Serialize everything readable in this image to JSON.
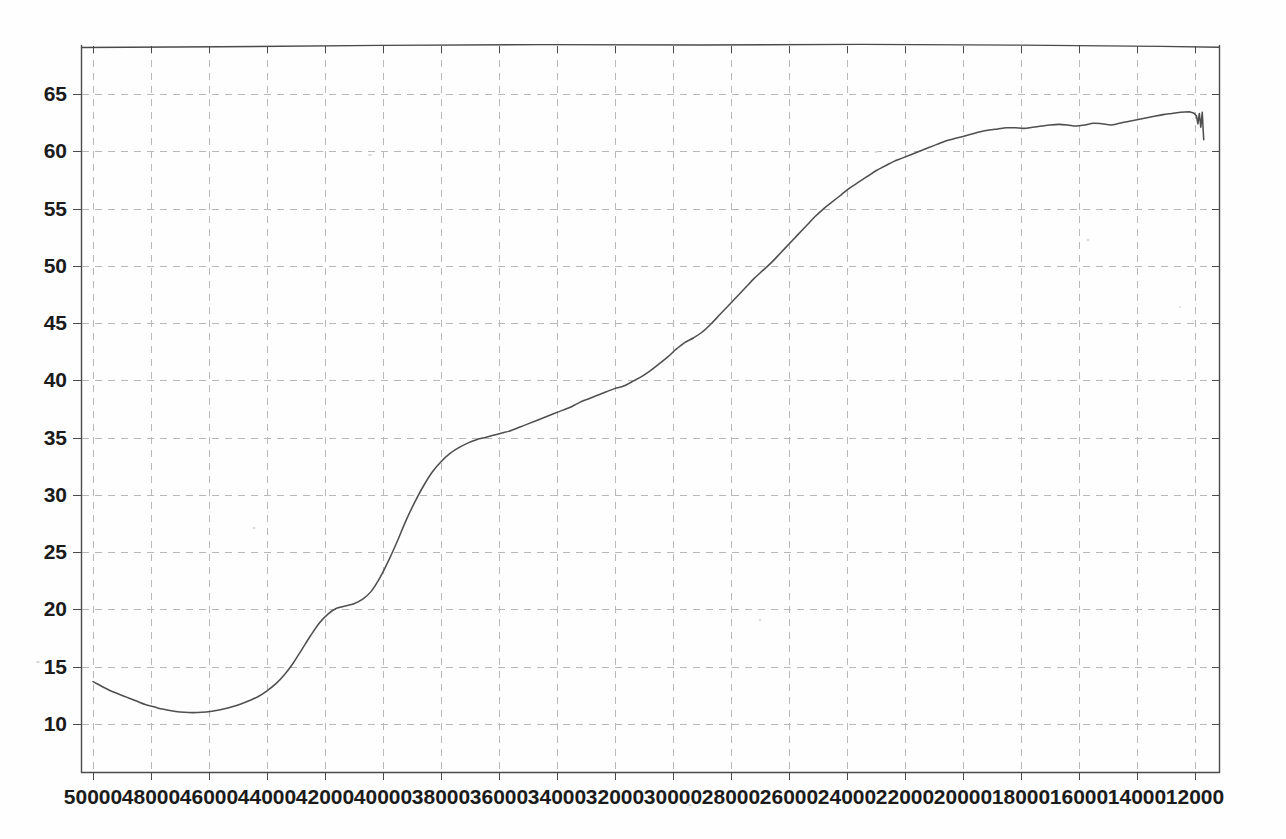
{
  "chart_data": {
    "type": "line",
    "title": "",
    "subtitle": "",
    "xlabel": "",
    "ylabel": "",
    "xlim": [
      50000,
      12000
    ],
    "ylim": [
      8.0,
      68.5
    ],
    "x_axis_reversed": true,
    "grid": true,
    "legend": null,
    "legend_position": "none",
    "line_color": "#4f4f4f",
    "grid_color": "#b9b9b9",
    "axis_color": "#4a4a4a",
    "background_color": "#fefefe",
    "x_tick_labels": [
      "50000",
      "48000",
      "46000",
      "44000",
      "42000",
      "40000",
      "38000",
      "36000",
      "34000",
      "32000",
      "30000",
      "28000",
      "26000",
      "24000",
      "22000",
      "20000",
      "18000",
      "16000",
      "14000",
      "12000"
    ],
    "x_ticks": [
      50000,
      48000,
      46000,
      44000,
      42000,
      40000,
      38000,
      36000,
      34000,
      32000,
      30000,
      28000,
      26000,
      24000,
      22000,
      20000,
      18000,
      16000,
      14000,
      12000
    ],
    "y_tick_labels": [
      "65",
      "60",
      "55",
      "50",
      "45",
      "40",
      "35",
      "30",
      "25",
      "20",
      "15",
      "10"
    ],
    "y_ticks": [
      65,
      60,
      55,
      50,
      45,
      40,
      35,
      30,
      25,
      20,
      15,
      10
    ],
    "annotations": [],
    "series": [
      {
        "name": "spectrum",
        "x": [
          50000,
          49700,
          49400,
          49100,
          48800,
          48500,
          48200,
          47900,
          47600,
          47300,
          47000,
          46700,
          46400,
          46100,
          45800,
          45500,
          45200,
          44900,
          44600,
          44300,
          44000,
          43700,
          43400,
          43100,
          42800,
          42500,
          42200,
          41900,
          41600,
          41300,
          41000,
          40700,
          40400,
          40100,
          39800,
          39500,
          39200,
          38900,
          38600,
          38300,
          38000,
          37700,
          37400,
          37100,
          36800,
          36500,
          36200,
          35900,
          35600,
          35300,
          35000,
          34700,
          34400,
          34100,
          33800,
          33500,
          33200,
          32900,
          32600,
          32300,
          32000,
          31700,
          31400,
          31100,
          30800,
          30500,
          30200,
          29900,
          29600,
          29300,
          29000,
          28700,
          28400,
          28100,
          27800,
          27500,
          27200,
          26900,
          26600,
          26300,
          26000,
          25700,
          25400,
          25100,
          24800,
          24500,
          24200,
          23900,
          23600,
          23300,
          23000,
          22700,
          22400,
          22100,
          21800,
          21500,
          21200,
          20900,
          20600,
          20300,
          20000,
          19700,
          19400,
          19100,
          18800,
          18500,
          18200,
          17900,
          17600,
          17300,
          17000,
          16700,
          16400,
          16100,
          15800,
          15500,
          15200,
          14900,
          14600,
          14300,
          14000,
          13700,
          13400,
          13100,
          12800,
          12500,
          12200,
          12050,
          11950,
          11900,
          11850,
          11800,
          11750,
          11700
        ],
        "y": [
          13.7,
          13.3,
          12.9,
          12.6,
          12.3,
          12.0,
          11.7,
          11.5,
          11.3,
          11.15,
          11.05,
          11.0,
          11.0,
          11.05,
          11.15,
          11.3,
          11.5,
          11.75,
          12.05,
          12.4,
          12.9,
          13.5,
          14.3,
          15.3,
          16.5,
          17.7,
          18.8,
          19.6,
          20.1,
          20.3,
          20.5,
          20.9,
          21.6,
          22.8,
          24.3,
          26.0,
          27.8,
          29.4,
          30.8,
          32.0,
          32.9,
          33.6,
          34.1,
          34.5,
          34.8,
          35.0,
          35.2,
          35.4,
          35.6,
          35.9,
          36.2,
          36.5,
          36.8,
          37.1,
          37.4,
          37.7,
          38.1,
          38.4,
          38.7,
          39.0,
          39.3,
          39.5,
          39.9,
          40.3,
          40.8,
          41.4,
          42.0,
          42.7,
          43.3,
          43.7,
          44.2,
          44.9,
          45.7,
          46.5,
          47.3,
          48.1,
          48.9,
          49.6,
          50.3,
          51.1,
          51.9,
          52.7,
          53.5,
          54.3,
          55.0,
          55.6,
          56.2,
          56.8,
          57.3,
          57.8,
          58.3,
          58.7,
          59.1,
          59.4,
          59.7,
          60.0,
          60.3,
          60.6,
          60.9,
          61.1,
          61.3,
          61.5,
          61.7,
          61.85,
          61.95,
          62.05,
          62.05,
          62.0,
          62.1,
          62.2,
          62.3,
          62.35,
          62.3,
          62.2,
          62.3,
          62.45,
          62.4,
          62.3,
          62.45,
          62.6,
          62.75,
          62.9,
          63.05,
          63.2,
          63.3,
          63.4,
          63.45,
          63.35,
          63.1,
          62.4,
          63.3,
          62.1,
          63.4,
          61.0
        ]
      }
    ]
  },
  "plot_geometry": {
    "left": 81,
    "right": 1220,
    "top": 45,
    "bottom": 773,
    "x_first_tick_px": 93,
    "x_tick_spacing_px": 58,
    "y_value_10_px": 724,
    "y_value_65_px": 94
  }
}
